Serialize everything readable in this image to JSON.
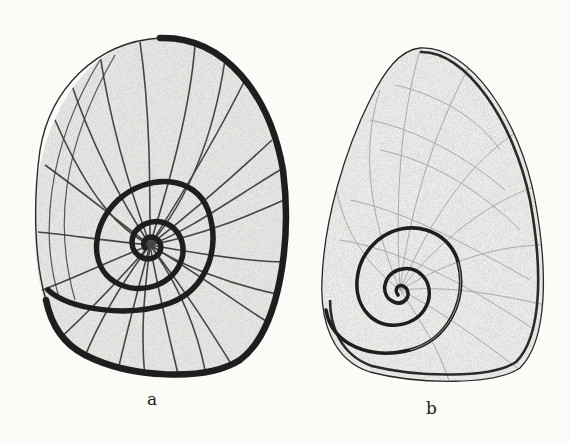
{
  "figure": {
    "type": "scientific-illustration",
    "colors": {
      "background": "#fbfbf8",
      "ink": "#1e1e1e",
      "stipple": "#8a8a8a"
    },
    "panels": [
      {
        "id": "a",
        "label": "a",
        "description": "oval operculum with heavy spiral suture and radiating ribs"
      },
      {
        "id": "b",
        "label": "b",
        "description": "egg-shaped operculum with fine growth lines and small basal spiral"
      }
    ]
  }
}
